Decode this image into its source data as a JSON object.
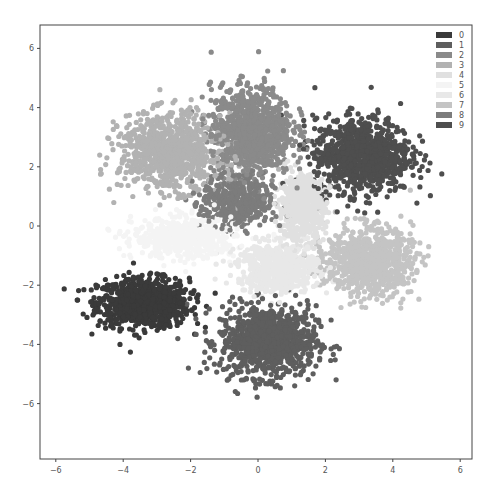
{
  "chart_data": {
    "type": "scatter",
    "title": "",
    "xlabel": "",
    "ylabel": "",
    "xlim": [
      -6.3,
      6.4
    ],
    "ylim": [
      -7.9,
      6.6
    ],
    "x_ticks": [
      -6,
      -4,
      -2,
      0,
      2,
      4,
      6
    ],
    "y_ticks": [
      6,
      4,
      2,
      0,
      -2,
      -4,
      -6
    ],
    "x_tick_labels": [
      "−6",
      "−4",
      "−2",
      "0",
      "2",
      "4",
      "6"
    ],
    "y_tick_labels": [
      "6",
      "4",
      "2",
      "0",
      "−2",
      "−4",
      "−6"
    ],
    "grid": false,
    "legend_position": "upper right",
    "legend": [
      "0",
      "1",
      "2",
      "3",
      "4",
      "5",
      "6",
      "7",
      "8",
      "9"
    ],
    "series": [
      {
        "name": "0",
        "color": "#3a3a3a",
        "center": [
          -3.4,
          -2.6
        ],
        "spread": [
          0.9,
          0.55
        ],
        "count": 900
      },
      {
        "name": "1",
        "color": "#5e5e5e",
        "center": [
          0.3,
          -3.9
        ],
        "spread": [
          0.95,
          0.8
        ],
        "count": 950
      },
      {
        "name": "2",
        "color": "#8a8a8a",
        "center": [
          -0.2,
          3.2
        ],
        "spread": [
          0.8,
          1.0
        ],
        "count": 950
      },
      {
        "name": "3",
        "color": "#b2b2b2",
        "center": [
          -2.6,
          2.5
        ],
        "spread": [
          1.0,
          0.85
        ],
        "count": 900
      },
      {
        "name": "4",
        "color": "#e0e0e0",
        "center": [
          1.3,
          0.6
        ],
        "spread": [
          0.45,
          0.7
        ],
        "count": 600
      },
      {
        "name": "5",
        "color": "#f4f4f4",
        "center": [
          -2.2,
          -0.4
        ],
        "spread": [
          1.0,
          0.45
        ],
        "count": 600
      },
      {
        "name": "6",
        "color": "#e8e8e8",
        "center": [
          0.6,
          -1.4
        ],
        "spread": [
          0.8,
          0.55
        ],
        "count": 650
      },
      {
        "name": "7",
        "color": "#c4c4c4",
        "center": [
          3.3,
          -1.2
        ],
        "spread": [
          0.85,
          0.75
        ],
        "count": 850
      },
      {
        "name": "8",
        "color": "#7c7c7c",
        "center": [
          -0.6,
          0.8
        ],
        "spread": [
          0.7,
          0.6
        ],
        "count": 450
      },
      {
        "name": "9",
        "color": "#4e4e4e",
        "center": [
          3.1,
          2.4
        ],
        "spread": [
          0.95,
          0.85
        ],
        "count": 950
      }
    ]
  },
  "axes": {
    "frame": {
      "left": 40,
      "top": 25,
      "right": 472,
      "bottom": 459
    },
    "x_origin_px": 258,
    "x_scale_px": 33.7,
    "y_origin_px": 226,
    "y_scale_px": 29.6
  }
}
